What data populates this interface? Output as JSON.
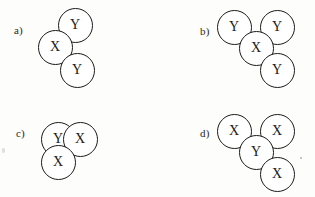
{
  "figure": {
    "background_color": "#fdfdfc",
    "stroke_color": "#1d1b19",
    "text_color": "#1d1b19",
    "node_diameter": 35
  },
  "panels": [
    {
      "id": "a",
      "label": "a)",
      "label_x": 14,
      "label_y": 25,
      "nodes": [
        {
          "label": "Y",
          "cx": 75,
          "cy": 25,
          "name": "node-a-y-top"
        },
        {
          "label": "X",
          "cx": 55,
          "cy": 47,
          "name": "node-a-x-left"
        },
        {
          "label": "Y",
          "cx": 77,
          "cy": 70,
          "name": "node-a-y-bottom"
        }
      ]
    },
    {
      "id": "b",
      "label": "b)",
      "label_x": 200,
      "label_y": 26,
      "nodes": [
        {
          "label": "Y",
          "cx": 234,
          "cy": 27,
          "name": "node-b-y-topleft"
        },
        {
          "label": "Y",
          "cx": 277,
          "cy": 27,
          "name": "node-b-y-topright"
        },
        {
          "label": "X",
          "cx": 256,
          "cy": 48,
          "name": "node-b-x-center"
        },
        {
          "label": "Y",
          "cx": 277,
          "cy": 70,
          "name": "node-b-y-bottomright"
        }
      ]
    },
    {
      "id": "c",
      "label": "c)",
      "label_x": 16,
      "label_y": 128,
      "nodes": [
        {
          "label": "Y",
          "cx": 58,
          "cy": 139,
          "name": "node-c-y-topleft"
        },
        {
          "label": "X",
          "cx": 80,
          "cy": 139,
          "name": "node-c-x-topright"
        },
        {
          "label": "X",
          "cx": 58,
          "cy": 162,
          "name": "node-c-x-bottom"
        }
      ]
    },
    {
      "id": "d",
      "label": "d)",
      "label_x": 200,
      "label_y": 128,
      "nodes": [
        {
          "label": "X",
          "cx": 234,
          "cy": 131,
          "name": "node-d-x-topleft"
        },
        {
          "label": "X",
          "cx": 277,
          "cy": 131,
          "name": "node-d-x-topright"
        },
        {
          "label": "Y",
          "cx": 256,
          "cy": 152,
          "name": "node-d-y-center"
        },
        {
          "label": "X",
          "cx": 277,
          "cy": 174,
          "name": "node-d-x-bottomright"
        }
      ]
    }
  ],
  "artifacts": [
    {
      "x": 300,
      "y": 157,
      "type": "dot"
    },
    {
      "x": 2,
      "y": 148,
      "type": "smudge"
    }
  ]
}
